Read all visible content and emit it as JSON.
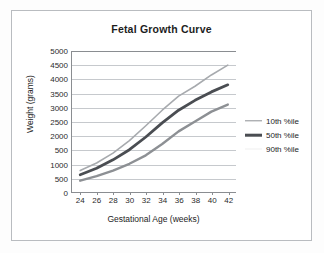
{
  "chart_data": {
    "type": "line",
    "title": "Fetal Growth Curve",
    "xlabel": "Gestational Age (weeks)",
    "ylabel": "Weight (grams)",
    "x": [
      24,
      26,
      28,
      30,
      32,
      34,
      36,
      38,
      40,
      42
    ],
    "xlim": [
      23,
      43
    ],
    "ylim": [
      0,
      5000
    ],
    "grid": "horizontal",
    "legend_position": "right",
    "x_tick_labels": [
      "24",
      "26",
      "28",
      "30",
      "32",
      "34",
      "36",
      "38",
      "40",
      "42"
    ],
    "y_tick_values": [
      0,
      500,
      1000,
      1500,
      2000,
      2500,
      3000,
      3500,
      4000,
      4500,
      5000
    ],
    "y_tick_labels": [
      "0",
      "500",
      "1000",
      "500",
      "2000",
      "2500",
      "3000",
      "3500",
      "4000",
      "4500",
      "5000"
    ],
    "series": [
      {
        "name": "10th %ile",
        "color": "#8d9094",
        "width": 2.4,
        "values": [
          400,
          560,
          760,
          1000,
          1300,
          1700,
          2150,
          2500,
          2850,
          3100
        ]
      },
      {
        "name": "50th %ile",
        "color": "#4a4d52",
        "width": 2.8,
        "values": [
          610,
          840,
          1140,
          1500,
          1950,
          2450,
          2900,
          3250,
          3550,
          3800
        ]
      },
      {
        "name": "90th %ile",
        "color": "#a7aaae",
        "width": 1.6,
        "values": [
          760,
          1030,
          1380,
          1820,
          2350,
          2900,
          3400,
          3750,
          4150,
          4500
        ]
      }
    ]
  },
  "legend": {
    "items": [
      {
        "label": "10th %ile",
        "color": "#8d9094",
        "weight": "w-thin"
      },
      {
        "label": "50th %ile",
        "color": "#4a4d52",
        "weight": "w-thick"
      },
      {
        "label": "90th %ile",
        "color": "#efefef",
        "weight": "w-faint"
      }
    ]
  }
}
